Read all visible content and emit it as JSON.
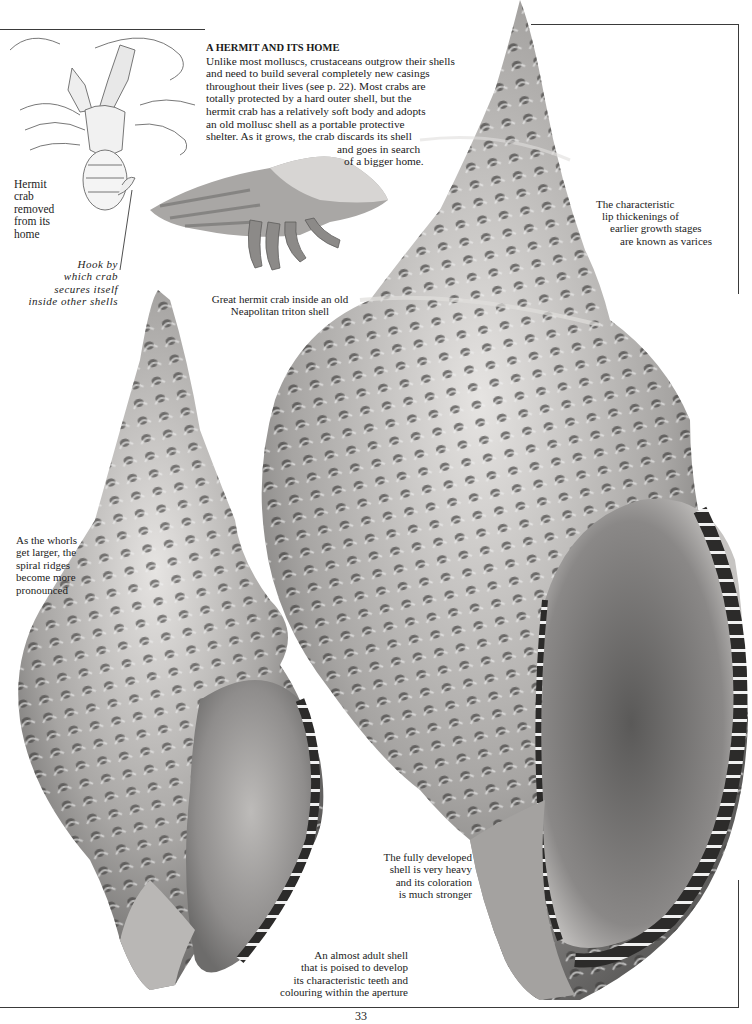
{
  "article": {
    "heading": "A HERMIT AND ITS HOME",
    "body_lines": [
      "Unlike most molluscs, crustaceans outgrow their shells",
      "and need to build several completely new casings",
      "throughout their lives (see p. 22). Most crabs are",
      "totally protected by a hard outer shell, but the",
      "hermit crab has a relatively soft body and adopts",
      "an old mollusc shell as a portable protective",
      "shelter. As it grows, the crab discards its shell",
      "and goes in search",
      "of a bigger home."
    ]
  },
  "captions": {
    "hermit_removed": [
      "Hermit",
      "crab",
      "removed",
      "from its",
      "home"
    ],
    "hook": [
      "Hook by",
      "which crab",
      "secures itself",
      "inside other shells"
    ],
    "great_hermit": [
      "Great hermit crab inside an old",
      "Neapolitan triton shell"
    ],
    "varices": [
      "The characteristic",
      "lip thickenings of",
      "earlier growth stages",
      "are known as varices"
    ],
    "whorls": [
      "As the whorls",
      "get larger, the",
      "spiral ridges",
      "become more",
      "pronounced"
    ],
    "fully_developed": [
      "The fully developed",
      "shell is very heavy",
      "and its coloration",
      "is much stronger"
    ],
    "almost_adult": [
      "An almost adult shell",
      "that is poised to develop",
      "its characteristic teeth and",
      "colouring within the aperture"
    ]
  },
  "illustrations": {
    "crab_drawing": "hermit-crab-line-drawing",
    "crab_in_shell": "hermit-crab-in-triton-shell-photo",
    "small_shell": "almost-adult-triton-shell-photo",
    "large_shell": "fully-developed-triton-shell-photo"
  },
  "colors": {
    "paper": "#ffffff",
    "ink": "#1a1a1a",
    "rule": "#3a3a3a",
    "shell_light": "#d8d6d4",
    "shell_mid": "#9a9896",
    "shell_dark": "#3c3b3a"
  },
  "page_number": "33"
}
